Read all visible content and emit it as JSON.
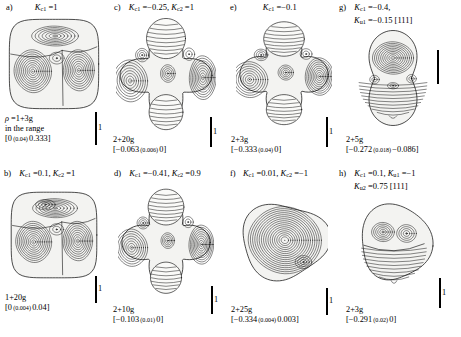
{
  "figure": {
    "type": "contour-surface-panels",
    "panel_count": 8,
    "scalebar_label": "1"
  },
  "panels": [
    {
      "id": "a",
      "tag": "a)",
      "params_lines": [
        "Kc1 = 1"
      ],
      "params_html": [
        "<span class=\"sym\">K</span><sub>c1</sub> =1"
      ],
      "note_lines": [
        "ρ =1+3g",
        "in the range",
        "[0 (0.04) 0.333]"
      ],
      "caption_lines": [],
      "shape": "rounded-cube",
      "scalebar_height": 33
    },
    {
      "id": "b",
      "tag": "b)",
      "params_lines": [
        "Kc1 = 0.1, Kc2 = 1"
      ],
      "params_html": [
        "<span class=\"sym\">K</span><sub>c1</sub> =0.1, <span class=\"sym\">K</span><sub>c2</sub> =1"
      ],
      "note_lines": [],
      "caption_lines": [
        "1+20g",
        "[0 (0.004) 0.04]"
      ],
      "caption_html": [
        "1+20g",
        "[0<span class=\"small\"> (0.004) </span>0.04]"
      ],
      "shape": "rounded-cube-b",
      "scalebar_height": 27
    },
    {
      "id": "c",
      "tag": "c)",
      "params_lines": [
        "Kc1 = -0.25, Kc2 = 1"
      ],
      "params_html": [
        "<span class=\"sym\">K</span><sub>c1</sub> =−0.25, <span class=\"sym\">K</span><sub>c2</sub> =1"
      ],
      "note_lines": [],
      "caption_lines": [
        "2+20g",
        "[-0.063 (0.006) 0]"
      ],
      "caption_html": [
        "2+20g",
        "[−0.063<span class=\"small\"> (0.006) </span>0]"
      ],
      "shape": "star-cross",
      "scalebar_height": 30
    },
    {
      "id": "d",
      "tag": "d)",
      "params_lines": [
        "Kc1 = -0.41, Kc2 = 0.9"
      ],
      "params_html": [
        "<span class=\"sym\">K</span><sub>c1</sub> =−0.41, <span class=\"sym\">K</span><sub>c2</sub> =0.9"
      ],
      "note_lines": [],
      "caption_lines": [
        "2+10g",
        "[-0.103 (0.01) 0]"
      ],
      "caption_html": [
        "2+10g",
        "[−0.103<span class=\"small\"> (0.01) </span>0]"
      ],
      "shape": "star-cross-d",
      "scalebar_height": 28
    },
    {
      "id": "e",
      "tag": "e)",
      "params_lines": [
        "Kc1 = -0.1"
      ],
      "params_html": [
        "<span class=\"sym\">K</span><sub>c1</sub> =−0.1"
      ],
      "note_lines": [],
      "caption_lines": [
        "2+3g",
        "[-0.333 (0.04) 0]"
      ],
      "caption_html": [
        "2+3g",
        "[−0.333<span class=\"small\"> (0.04) </span>0]"
      ],
      "shape": "star-cross-e",
      "scalebar_height": 30
    },
    {
      "id": "f",
      "tag": "f)",
      "params_lines": [
        "Kc1 = 0.01, Kc2 = -1"
      ],
      "params_html": [
        "<span class=\"sym\">K</span><sub>c1</sub> =0.01, <span class=\"sym\">K</span><sub>c2</sub> =−1"
      ],
      "note_lines": [],
      "caption_lines": [
        "2+25g",
        "[-0.334 (0.004) 0.003]"
      ],
      "caption_html": [
        "2+25g",
        "[−0.334<span class=\"small\"> (0.004) </span>0.003]"
      ],
      "shape": "blob-f",
      "scalebar_height": 27
    },
    {
      "id": "g",
      "tag": "g)",
      "params_lines": [
        "Kc1 = -0.4,",
        "Ku1 = -0.15 [111]"
      ],
      "params_html": [
        "<span class=\"sym\">K</span><sub>c1</sub> =−0.4,",
        "<span class=\"sym\">K</span><sub>u1</sub> =−0.15 [111]"
      ],
      "note_lines": [],
      "caption_lines": [
        "2+5g",
        "[-0.272 (0.018) -0.086]"
      ],
      "caption_html": [
        "2+5g",
        "[−0.272<span class=\"small\"> (0.018) </span>−0.086]"
      ],
      "shape": "peanut-g",
      "scalebar_height": 34
    },
    {
      "id": "h",
      "tag": "h)",
      "params_lines": [
        "Kc1 = 0.1, Ku1 = -1",
        "Ku2 = 0.75 [111]"
      ],
      "params_html": [
        "<span class=\"sym\">K</span><sub>c1</sub> =0.1, <span class=\"sym\">K</span><sub>u1</sub> =−1",
        "<span class=\"sym\">K</span><sub>u2</sub> =0.75 [111]"
      ],
      "note_lines": [],
      "caption_lines": [
        "2+3g",
        "[-0.291 (0.02) 0]"
      ],
      "caption_html": [
        "2+3g",
        "[−0.291<span class=\"small\"> (0.02) </span>0]"
      ],
      "shape": "dome-h",
      "scalebar_height": 30
    }
  ]
}
